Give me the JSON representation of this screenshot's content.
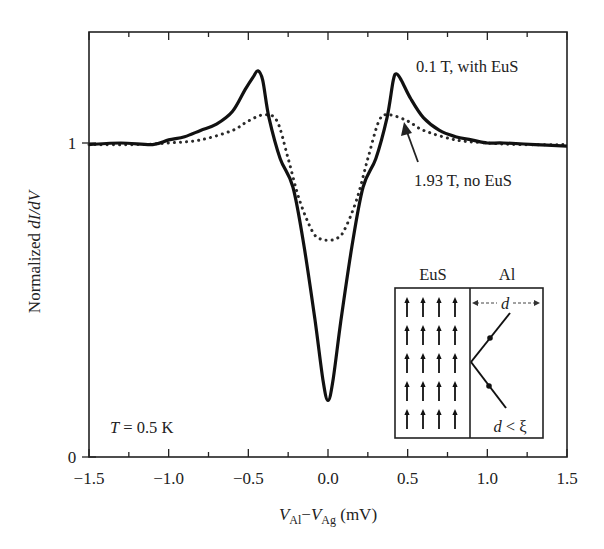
{
  "chart_data": {
    "type": "line",
    "title": "",
    "xlabel": "V_Al − V_Ag (mV)",
    "ylabel": "Normalized dI/dV",
    "xlim": [
      -1.5,
      1.5
    ],
    "ylim": [
      0,
      1.2
    ],
    "grid": false,
    "legend": "none (curves labeled by inline annotations)",
    "x_ticks": [
      -1.5,
      -1.0,
      -0.5,
      0.0,
      0.5,
      1.0,
      1.5
    ],
    "x_tick_labels": [
      "−1.5",
      "−1.0",
      "−0.5",
      "0.0",
      "0.5",
      "1.0",
      "1.5"
    ],
    "y_ticks": [
      0,
      1
    ],
    "y_tick_labels": [
      "0",
      "1"
    ],
    "series": [
      {
        "name": "0.1 T, with EuS",
        "style": "solid",
        "x": [
          -1.5,
          -1.3,
          -1.1,
          -1.0,
          -0.9,
          -0.8,
          -0.7,
          -0.6,
          -0.52,
          -0.47,
          -0.44,
          -0.41,
          -0.37,
          -0.3,
          -0.22,
          -0.15,
          -0.08,
          -0.03,
          0.0,
          0.03,
          0.08,
          0.15,
          0.22,
          0.3,
          0.37,
          0.41,
          0.43,
          0.46,
          0.52,
          0.6,
          0.7,
          0.8,
          0.9,
          1.0,
          1.1,
          1.3,
          1.5
        ],
        "y": [
          0.995,
          1.0,
          0.995,
          1.01,
          1.02,
          1.04,
          1.06,
          1.1,
          1.17,
          1.21,
          1.23,
          1.2,
          1.08,
          0.95,
          0.86,
          0.67,
          0.43,
          0.24,
          0.18,
          0.24,
          0.43,
          0.67,
          0.86,
          0.95,
          1.08,
          1.2,
          1.22,
          1.2,
          1.14,
          1.08,
          1.04,
          1.02,
          1.01,
          1.0,
          1.0,
          0.995,
          0.99
        ]
      },
      {
        "name": "1.93 T, no EuS",
        "style": "dotted",
        "x": [
          -1.5,
          -1.2,
          -1.0,
          -0.8,
          -0.6,
          -0.5,
          -0.4,
          -0.32,
          -0.25,
          -0.18,
          -0.1,
          -0.05,
          0.0,
          0.05,
          0.1,
          0.18,
          0.25,
          0.32,
          0.38,
          0.5,
          0.6,
          0.8,
          1.0,
          1.2,
          1.5
        ],
        "y": [
          0.995,
          0.995,
          1.0,
          1.01,
          1.04,
          1.07,
          1.09,
          1.07,
          0.95,
          0.82,
          0.72,
          0.695,
          0.69,
          0.695,
          0.72,
          0.82,
          0.95,
          1.07,
          1.09,
          1.07,
          1.04,
          1.01,
          1.0,
          0.995,
          0.995
        ]
      }
    ],
    "annotations": [
      {
        "text": "0.1 T, with EuS",
        "x": 0.55,
        "y": 1.25
      },
      {
        "text": "1.93 T, no EuS",
        "x": 0.55,
        "y": 0.88,
        "arrow_to": [
          0.48,
          1.06
        ]
      },
      {
        "text": "T = 0.5 K",
        "x": -1.35,
        "y": 0.1
      }
    ],
    "inset": {
      "description": "Schematic of EuS/Al bilayer",
      "left_label": "EuS",
      "right_label": "Al",
      "spin_arrows": {
        "columns": 4,
        "rows": 5,
        "direction": "up"
      },
      "thickness_label": "d",
      "condition_label": "d < ξ"
    }
  },
  "labels": {
    "xlabel_V1": "V",
    "xlabel_sub1": "Al",
    "xlabel_minus": "−",
    "xlabel_V2": "V",
    "xlabel_sub2": "Ag",
    "xlabel_unit": " (mV)",
    "ylabel_prefix": "Normalized ",
    "ylabel_italic": "dI/dV",
    "annot_solid": "0.1 T, with EuS",
    "annot_dotted": "1.93 T, no EuS",
    "temp_T": "T",
    "temp_rest": " = 0.5 K",
    "inset_left": "EuS",
    "inset_right": "Al",
    "inset_d": "d",
    "inset_cond_d": "d",
    "inset_cond_rest": " < ξ",
    "x_tick_labels": [
      "−1.5",
      "−1.0",
      "−0.5",
      "0.0",
      "0.5",
      "1.0",
      "1.5"
    ],
    "y_tick_labels": [
      "0",
      "1"
    ]
  }
}
